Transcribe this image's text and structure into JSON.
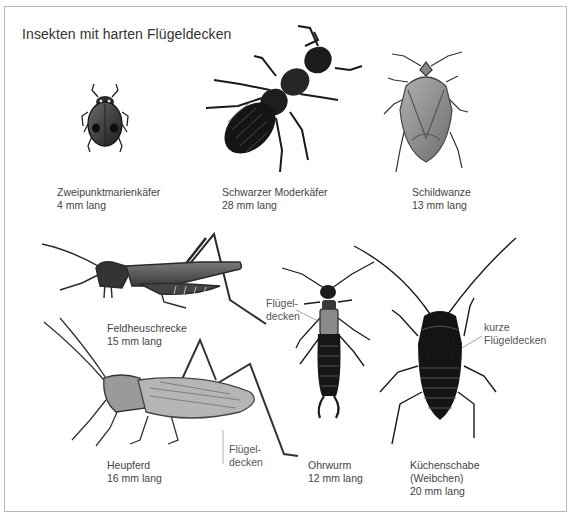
{
  "title": "Insekten mit harten Flügeldecken",
  "insects": [
    {
      "name": "Zweipunktmarienkäfer",
      "size": "4 mm lang"
    },
    {
      "name": "Schwarzer Moderkäfer",
      "size": "28 mm lang"
    },
    {
      "name": "Schildwanze",
      "size": "13 mm lang"
    },
    {
      "name": "Feldheuschrecke",
      "size": "15 mm lang"
    },
    {
      "name": "Heupferd",
      "size": "16 mm lang"
    },
    {
      "name": "Ohrwurm",
      "size": "12 mm lang"
    },
    {
      "name": "Küchenschabe",
      "note": "(Weibchen)",
      "size": "20 mm lang"
    }
  ],
  "callouts": {
    "ohrwurm_wings": {
      "line1": "Flügel-",
      "line2": "decken"
    },
    "heupferd_wings": {
      "line1": "Flügel-",
      "line2": "decken"
    },
    "schabe_wings": {
      "line1": "kurze",
      "line2": "Flügeldecken"
    }
  },
  "colors": {
    "frame": "#b8b8b8",
    "text": "#444444",
    "insect_dark": "#1e1e1e",
    "insect_mid": "#5a5a5a",
    "insect_light": "#9a9a9a"
  }
}
